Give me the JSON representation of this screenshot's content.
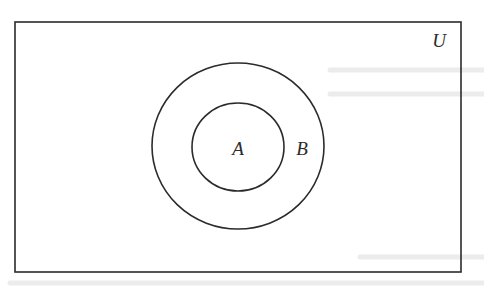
{
  "diagram": {
    "type": "venn",
    "universe": {
      "label": "U",
      "rect": {
        "x": 15,
        "y": 22,
        "width": 446,
        "height": 250
      }
    },
    "sets": [
      {
        "id": "B",
        "label": "B",
        "cx": 238,
        "cy": 146,
        "rx": 86,
        "ry": 83,
        "label_pos": {
          "x": 302,
          "y": 155
        }
      },
      {
        "id": "A",
        "label": "A",
        "cx": 238,
        "cy": 147,
        "rx": 46,
        "ry": 44,
        "label_pos": {
          "x": 238,
          "y": 155
        }
      }
    ],
    "relations": [
      "A ⊂ B",
      "B ⊂ U"
    ],
    "colors": {
      "stroke": "#2b2b2b",
      "background": "#ffffff"
    }
  }
}
